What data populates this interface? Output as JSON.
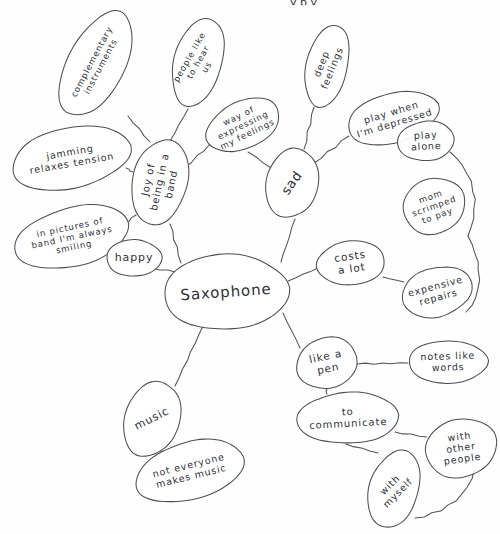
{
  "document": {
    "title": "Saxophone Mind Map",
    "medium": "hand-drawn pencil sketch on white paper",
    "width": 500,
    "height": 534,
    "ink_color": "#4d4d57",
    "paper_color": "#fefefe"
  },
  "top_cropped_text": "y p y",
  "nodes": [
    {
      "id": "saxophone",
      "label": "Saxophone",
      "role": "central",
      "cx": 226,
      "cy": 292,
      "rx": 62,
      "ry": 38,
      "rot": -4,
      "font_size": 15,
      "lines": [
        "Saxophone"
      ]
    },
    {
      "id": "joy-of-being-in-a-band",
      "label": "Joy of being in a band",
      "role": "branch",
      "cx": 160,
      "cy": 182,
      "rx": 27,
      "ry": 44,
      "rot": 12,
      "font_size": 10,
      "lines": [
        "Joy of",
        "being in a",
        "band"
      ],
      "text_rot": -78
    },
    {
      "id": "complementary-instruments",
      "label": "complementary instruments",
      "role": "leaf",
      "cx": 96,
      "cy": 64,
      "rx": 29,
      "ry": 56,
      "rot": 27,
      "font_size": 8.5,
      "lines": [
        "complementary",
        "instruments"
      ],
      "text_rot": -62
    },
    {
      "id": "people-like-to-hear-us",
      "label": "people like to hear us",
      "role": "leaf",
      "cx": 198,
      "cy": 62,
      "rx": 24,
      "ry": 45,
      "rot": 17,
      "font_size": 8.5,
      "lines": [
        "people like",
        "to hear",
        "us"
      ],
      "text_rot": -60
    },
    {
      "id": "jamming-relaxes-tension",
      "label": "jamming relaxes tension",
      "role": "leaf",
      "cx": 71,
      "cy": 158,
      "rx": 59,
      "ry": 31,
      "rot": -12,
      "font_size": 9.5,
      "lines": [
        "jamming",
        "relaxes tension"
      ],
      "text_rot": -10
    },
    {
      "id": "in-pictures-of-band",
      "label": "in pictures of band I'm always smiling",
      "role": "leaf",
      "cx": 72,
      "cy": 237,
      "rx": 59,
      "ry": 29,
      "rot": -13,
      "font_size": 8.5,
      "lines": [
        "in pictures of",
        "band I'm always",
        "smiling"
      ],
      "text_rot": -12
    },
    {
      "id": "happy",
      "label": "happy",
      "role": "leaf",
      "cx": 134,
      "cy": 258,
      "rx": 28,
      "ry": 18,
      "rot": -2,
      "font_size": 11,
      "lines": [
        "happy"
      ],
      "text_rot": 0
    },
    {
      "id": "way-of-expressing-my-feelings",
      "label": "way of expressing my feelings",
      "role": "leaf",
      "cx": 243,
      "cy": 125,
      "rx": 38,
      "ry": 24,
      "rot": -26,
      "font_size": 8.5,
      "lines": [
        "way of",
        "expressing",
        "my feelings"
      ],
      "text_rot": -26
    },
    {
      "id": "sad",
      "label": "sad",
      "role": "branch",
      "cx": 292,
      "cy": 183,
      "rx": 26,
      "ry": 35,
      "rot": 10,
      "font_size": 13,
      "lines": [
        "sad"
      ],
      "text_rot": -55
    },
    {
      "id": "deep-feelings",
      "label": "deep feelings",
      "role": "leaf",
      "cx": 327,
      "cy": 66,
      "rx": 21,
      "ry": 41,
      "rot": 13,
      "font_size": 9.5,
      "lines": [
        "deep",
        "feelings"
      ],
      "text_rot": -68
    },
    {
      "id": "play-when-im-depressed",
      "label": "play when I'm depressed",
      "role": "leaf",
      "cx": 393,
      "cy": 118,
      "rx": 46,
      "ry": 25,
      "rot": -17,
      "font_size": 9.5,
      "lines": [
        "play when",
        "I'm depressed"
      ],
      "text_rot": -17
    },
    {
      "id": "play-alone",
      "label": "play alone",
      "role": "leaf",
      "cx": 426,
      "cy": 141,
      "rx": 28,
      "ry": 20,
      "rot": -3,
      "font_size": 9.5,
      "lines": [
        "play",
        "alone"
      ],
      "text_rot": -3
    },
    {
      "id": "mom-scrimped-to-pay",
      "label": "mom scrimped to pay",
      "role": "leaf",
      "cx": 434,
      "cy": 206,
      "rx": 32,
      "ry": 27,
      "rot": -20,
      "font_size": 8.5,
      "lines": [
        "mom",
        "scrimped",
        "to pay"
      ],
      "text_rot": -20
    },
    {
      "id": "costs-a-lot",
      "label": "costs a lot",
      "role": "branch",
      "cx": 351,
      "cy": 263,
      "rx": 34,
      "ry": 22,
      "rot": -8,
      "font_size": 10.5,
      "lines": [
        "costs",
        "a lot"
      ],
      "text_rot": -8
    },
    {
      "id": "expensive-repairs",
      "label": "expensive repairs",
      "role": "leaf",
      "cx": 437,
      "cy": 292,
      "rx": 35,
      "ry": 25,
      "rot": -15,
      "font_size": 9.5,
      "lines": [
        "expensive",
        "repairs"
      ],
      "text_rot": -15
    },
    {
      "id": "like-a-pen",
      "label": "like a pen",
      "role": "branch",
      "cx": 327,
      "cy": 363,
      "rx": 31,
      "ry": 25,
      "rot": -12,
      "font_size": 10.5,
      "lines": [
        "like a",
        "pen"
      ],
      "text_rot": -12
    },
    {
      "id": "notes-like-words",
      "label": "notes like words",
      "role": "leaf",
      "cx": 448,
      "cy": 362,
      "rx": 40,
      "ry": 21,
      "rot": -2,
      "font_size": 9.5,
      "lines": [
        "notes like",
        "words"
      ],
      "text_rot": -2
    },
    {
      "id": "to-communicate",
      "label": "to communicate",
      "role": "branch",
      "cx": 348,
      "cy": 418,
      "rx": 50,
      "ry": 26,
      "rot": -3,
      "font_size": 10,
      "lines": [
        "to",
        "communicate"
      ],
      "text_rot": -3
    },
    {
      "id": "with-other-people",
      "label": "with other people",
      "role": "leaf",
      "cx": 461,
      "cy": 448,
      "rx": 36,
      "ry": 29,
      "rot": -10,
      "font_size": 9.5,
      "lines": [
        "with",
        "other",
        "people"
      ],
      "text_rot": -8
    },
    {
      "id": "with-myself",
      "label": "with myself",
      "role": "leaf",
      "cx": 394,
      "cy": 489,
      "rx": 25,
      "ry": 39,
      "rot": 18,
      "font_size": 9.5,
      "lines": [
        "with",
        "myself"
      ],
      "text_rot": -45
    },
    {
      "id": "music",
      "label": "music",
      "role": "branch",
      "cx": 152,
      "cy": 419,
      "rx": 27,
      "ry": 39,
      "rot": 22,
      "font_size": 11,
      "lines": [
        "music"
      ],
      "text_rot": -27
    },
    {
      "id": "not-everyone-makes-music",
      "label": "not everyone makes music",
      "role": "leaf",
      "cx": 190,
      "cy": 471,
      "rx": 55,
      "ry": 29,
      "rot": -14,
      "font_size": 9.5,
      "lines": [
        "not everyone",
        "makes music"
      ],
      "text_rot": -14
    }
  ],
  "edges": [
    {
      "from": "saxophone",
      "to": "joy-of-being-in-a-band",
      "path": "M 181 263 L 170 224"
    },
    {
      "from": "saxophone",
      "to": "happy",
      "path": "M 175 272 L 152 268"
    },
    {
      "from": "saxophone",
      "to": "sad",
      "path": "M 281 262 L 295 219"
    },
    {
      "from": "saxophone",
      "to": "costs-a-lot",
      "path": "M 288 281 L 318 268"
    },
    {
      "from": "saxophone",
      "to": "like-a-pen",
      "path": "M 283 313 L 300 348"
    },
    {
      "from": "saxophone",
      "to": "music",
      "path": "M 203 326 L 175 386"
    },
    {
      "from": "joy-of-being-in-a-band",
      "to": "complementary-instruments",
      "path": "M 150 142 L 128 116"
    },
    {
      "from": "joy-of-being-in-a-band",
      "to": "people-like-to-hear-us",
      "path": "M 170 141 L 188 109"
    },
    {
      "from": "joy-of-being-in-a-band",
      "to": "jamming-relaxes-tension",
      "path": "M 133 172 L 126 168"
    },
    {
      "from": "joy-of-being-in-a-band",
      "to": "in-pictures-of-band",
      "path": "M 136 215 L 125 224"
    },
    {
      "from": "joy-of-being-in-a-band",
      "to": "way-of-expressing-my-feelings",
      "path": "M 186 167 L 209 145"
    },
    {
      "from": "sad",
      "to": "way-of-expressing-my-feelings",
      "path": "M 271 168 L 248 152"
    },
    {
      "from": "sad",
      "to": "deep-feelings",
      "path": "M 304 149 L 314 107"
    },
    {
      "from": "sad",
      "to": "play-when-im-depressed",
      "path": "M 314 163 L 349 136"
    },
    {
      "from": "play-when-im-depressed",
      "to": "play-alone",
      "path": "M 414 137 L 408 134"
    },
    {
      "from": "play-alone",
      "to": "mom-scrimped-to-pay",
      "path": "M 450 152 C 480 178, 478 212, 468 236"
    },
    {
      "from": "costs-a-lot",
      "to": "expensive-repairs",
      "path": "M 383 277 L 404 282"
    },
    {
      "from": "like-a-pen",
      "to": "notes-like-words",
      "path": "M 357 364 L 408 363"
    },
    {
      "from": "like-a-pen",
      "to": "to-communicate",
      "path": "M 326 388 L 327 394"
    },
    {
      "from": "to-communicate",
      "to": "with-other-people",
      "path": "M 395 432 L 427 437"
    },
    {
      "from": "to-communicate",
      "to": "with-myself",
      "path": "M 346 444 L 378 453"
    },
    {
      "from": "with-myself",
      "to": "with-other-people",
      "path": "M 415 518 C 450 512, 470 492, 474 470"
    },
    {
      "from": "music",
      "to": "not-everyone-makes-music",
      "path": "M 159 456 L 163 446"
    },
    {
      "from": "mom-scrimped-to-pay",
      "to": "expensive-repairs",
      "path": "M 468 236 C 486 270, 480 300, 466 312"
    }
  ]
}
